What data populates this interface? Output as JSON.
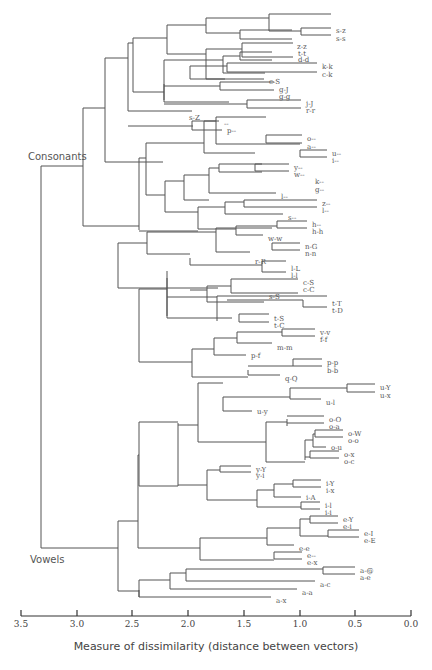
{
  "groups": [
    {
      "label": "Consonants",
      "x": 28,
      "y": 160
    },
    {
      "label": "Vowels",
      "x": 30,
      "y": 563
    }
  ],
  "axis": {
    "label": "Measure of dissimilarity (distance between vectors)",
    "y": 616,
    "x0": 21,
    "x1": 411,
    "ticks": [
      {
        "label": "3.5",
        "x": 21
      },
      {
        "label": "3.0",
        "x": 77
      },
      {
        "label": "2.5",
        "x": 132
      },
      {
        "label": "2.0",
        "x": 188
      },
      {
        "label": "1.5",
        "x": 244
      },
      {
        "label": "1.0",
        "x": 300
      },
      {
        "label": "0.5",
        "x": 355
      },
      {
        "label": "0.0",
        "x": 411
      }
    ]
  },
  "leaves": [
    {
      "label": "s-z",
      "x": 334,
      "y": 30
    },
    {
      "label": "s-s",
      "x": 334,
      "y": 38
    },
    {
      "label": "z-z",
      "x": 295,
      "y": 46
    },
    {
      "label": "t-t",
      "x": 296,
      "y": 53
    },
    {
      "label": "d-d",
      "x": 296,
      "y": 59
    },
    {
      "label": "k-k",
      "x": 320,
      "y": 66
    },
    {
      "label": "c-k",
      "x": 320,
      "y": 74
    },
    {
      "label": "c-S",
      "x": 267,
      "y": 81
    },
    {
      "label": "g-J",
      "x": 277,
      "y": 89
    },
    {
      "label": "g-g",
      "x": 277,
      "y": 96
    },
    {
      "label": "j-J",
      "x": 304,
      "y": 103
    },
    {
      "label": "r-r",
      "x": 304,
      "y": 110
    },
    {
      "label": "s-Z",
      "x": 187,
      "y": 117
    },
    {
      "label": "--",
      "x": 222,
      "y": 123
    },
    {
      "label": "p--",
      "x": 225,
      "y": 130
    },
    {
      "label": "o--",
      "x": 305,
      "y": 138
    },
    {
      "label": "a--",
      "x": 305,
      "y": 146
    },
    {
      "label": "u--",
      "x": 330,
      "y": 153
    },
    {
      "label": "i--",
      "x": 330,
      "y": 160
    },
    {
      "label": "y--",
      "x": 292,
      "y": 167
    },
    {
      "label": "w--",
      "x": 292,
      "y": 174
    },
    {
      "label": "k--",
      "x": 313,
      "y": 181
    },
    {
      "label": "g--",
      "x": 313,
      "y": 189
    },
    {
      "label": "l--",
      "x": 279,
      "y": 196
    },
    {
      "label": "z--",
      "x": 320,
      "y": 203
    },
    {
      "label": "l--",
      "x": 320,
      "y": 210
    },
    {
      "label": "s--",
      "x": 286,
      "y": 217
    },
    {
      "label": "h--",
      "x": 310,
      "y": 224
    },
    {
      "label": "h-h",
      "x": 310,
      "y": 231
    },
    {
      "label": "w-w",
      "x": 266,
      "y": 238
    },
    {
      "label": "n-G",
      "x": 303,
      "y": 246
    },
    {
      "label": "n-n",
      "x": 303,
      "y": 253
    },
    {
      "label": "r-R",
      "x": 253,
      "y": 261
    },
    {
      "label": "l-L",
      "x": 289,
      "y": 268
    },
    {
      "label": "l-l",
      "x": 289,
      "y": 275
    },
    {
      "label": "c-S",
      "x": 301,
      "y": 282
    },
    {
      "label": "c-C",
      "x": 301,
      "y": 289
    },
    {
      "label": "s-S",
      "x": 267,
      "y": 296
    },
    {
      "label": "t-T",
      "x": 330,
      "y": 303
    },
    {
      "label": "t-D",
      "x": 330,
      "y": 310
    },
    {
      "label": "t-S",
      "x": 272,
      "y": 318
    },
    {
      "label": "t-C",
      "x": 272,
      "y": 325
    },
    {
      "label": "v-v",
      "x": 318,
      "y": 332
    },
    {
      "label": "f-f",
      "x": 318,
      "y": 339
    },
    {
      "label": "m-m",
      "x": 275,
      "y": 347
    },
    {
      "label": "p-f",
      "x": 249,
      "y": 355
    },
    {
      "label": "p-p",
      "x": 325,
      "y": 362
    },
    {
      "label": "b-b",
      "x": 325,
      "y": 370
    },
    {
      "label": "q-Q",
      "x": 283,
      "y": 378
    },
    {
      "label": "u-Y",
      "x": 378,
      "y": 387
    },
    {
      "label": "u-x",
      "x": 378,
      "y": 395
    },
    {
      "label": "u-l",
      "x": 324,
      "y": 402
    },
    {
      "label": "u-y",
      "x": 255,
      "y": 411
    },
    {
      "label": "o-O",
      "x": 327,
      "y": 419
    },
    {
      "label": "o-a",
      "x": 327,
      "y": 426
    },
    {
      "label": "o-W",
      "x": 346,
      "y": 433
    },
    {
      "label": "o-o",
      "x": 346,
      "y": 440
    },
    {
      "label": "o-u",
      "x": 329,
      "y": 447
    },
    {
      "label": "o-x",
      "x": 342,
      "y": 454
    },
    {
      "label": "o-c",
      "x": 342,
      "y": 461
    },
    {
      "label": "y-Y",
      "x": 254,
      "y": 469
    },
    {
      "label": "y-i",
      "x": 254,
      "y": 475
    },
    {
      "label": "i-Y",
      "x": 324,
      "y": 483
    },
    {
      "label": "i-x",
      "x": 324,
      "y": 490
    },
    {
      "label": "i-A",
      "x": 304,
      "y": 497
    },
    {
      "label": "i-l",
      "x": 323,
      "y": 505
    },
    {
      "label": "i-i",
      "x": 323,
      "y": 512
    },
    {
      "label": "e-Y",
      "x": 341,
      "y": 519
    },
    {
      "label": "e-i",
      "x": 341,
      "y": 526
    },
    {
      "label": "e-I",
      "x": 362,
      "y": 533
    },
    {
      "label": "e-E",
      "x": 362,
      "y": 540
    },
    {
      "label": "e-e",
      "x": 297,
      "y": 548
    },
    {
      "label": "e--",
      "x": 305,
      "y": 555
    },
    {
      "label": "e-x",
      "x": 305,
      "y": 562
    },
    {
      "label": "a-@",
      "x": 358,
      "y": 570
    },
    {
      "label": "a-e",
      "x": 358,
      "y": 577
    },
    {
      "label": "a-c",
      "x": 318,
      "y": 584
    },
    {
      "label": "a-a",
      "x": 300,
      "y": 592
    },
    {
      "label": "a-x",
      "x": 274,
      "y": 600
    }
  ],
  "branches": [
    "M41,166 L41,548",
    "M41,166 L83,166",
    "M41,548 L118,548",
    "M83,108 L83,226",
    "M83,108 L105,108",
    "M83,226 L139,226",
    "M105,58 L105,162",
    "M105,58 L128,58",
    "M105,162 L163,162",
    "M128,43 L128,111",
    "M128,43 L133,43",
    "M128,111 L192,111",
    "M128,126 L193,126",
    "M133,38 L133,92",
    "M133,38 L167,38",
    "M133,92 L164,92",
    "M167,25 L167,54",
    "M167,25 L206,25",
    "M167,54 L206,54",
    "M206,18 L206,33",
    "M206,18 L269,18",
    "M206,33 L240,33",
    "M269,14 L269,31",
    "M269,14 L331,14",
    "M269,31 L301,31",
    "M301,28 L301,35",
    "M301,28 L331,28",
    "M301,35 L331,35",
    "M240,30 L240,39",
    "M240,30 L292,30",
    "M240,39 L292,39",
    "M206,54 L206,54",
    "M206,49 L206,79",
    "M206,49 L242,49",
    "M206,79 L264,79",
    "M242,43 L242,57",
    "M242,43 L293,43",
    "M242,57 L293,57",
    "M164,60 L164,102",
    "M164,60 L223,60",
    "M164,102 L229,102",
    "M223,56 L223,73",
    "M223,56 L240,56",
    "M223,73 L265,73",
    "M240,52 L240,60",
    "M240,52 L272,52",
    "M240,60 L272,60",
    "M190,66 L190,79",
    "M190,66 L227,66",
    "M190,79 L225,79",
    "M227,63 L227,72",
    "M227,63 L317,63",
    "M227,72 L317,72",
    "M164,100 L164,100",
    "M164,84 L164,100",
    "M164,86 L220,86",
    "M220,82 L220,90",
    "M220,82 L274,82",
    "M220,90 L274,90",
    "M164,104 L247,104",
    "M247,100 L247,108",
    "M247,100 L301,100",
    "M247,108 L301,108",
    "M192,121 L192,130",
    "M192,121 L219,121",
    "M192,130 L222,130",
    "M139,158 L139,230",
    "M139,158 L146,158",
    "M139,231 L198,231",
    "M146,143 L146,195",
    "M146,143 L204,143",
    "M146,195 L165,195",
    "M204,121 L204,153",
    "M204,121 L216,121",
    "M204,153 L255,153",
    "M216,117 L216,144",
    "M216,117 L266,117",
    "M216,144 L300,144",
    "M266,135 L266,143",
    "M266,135 L302,135",
    "M266,143 L302,143",
    "M300,150 L300,157",
    "M300,150 L327,150",
    "M300,157 L327,157",
    "M255,164 L255,171",
    "M255,164 L289,164",
    "M255,171 L289,171",
    "M165,181 L165,212",
    "M165,181 L184,181",
    "M165,212 L198,212",
    "M184,175 L184,200",
    "M184,175 L209,175",
    "M184,200 L209,200",
    "M209,168 L209,193",
    "M209,168 L219,168",
    "M209,193 L276,193",
    "M219,164 L219,172",
    "M219,164 L262,164",
    "M219,172 L262,172",
    "M198,207 L198,229",
    "M198,207 L225,207",
    "M198,229 L236,229",
    "M225,202 L225,214",
    "M225,202 L244,202",
    "M225,214 L283,214",
    "M244,200 L244,207",
    "M244,200 L317,200",
    "M244,207 L317,207",
    "M236,226 L236,235",
    "M236,226 L277,226",
    "M236,235 L263,235",
    "M277,221 L277,228",
    "M277,221 L307,221",
    "M277,228 L307,228",
    "M118,243 L118,288",
    "M118,243 L147,243",
    "M118,288 L218,288",
    "M147,232 L147,254",
    "M147,232 L216,232",
    "M147,254 L190,254",
    "M216,228 L216,252",
    "M216,228 L272,228",
    "M216,252 L250,252",
    "M272,243 L272,250",
    "M272,243 L300,243",
    "M272,250 L300,250",
    "M190,258 L190,265",
    "M190,265 L262,265",
    "M262,261 L262,272",
    "M262,261 L286,261",
    "M262,272 L286,272",
    "M139,289 L139,362",
    "M139,289 L167,289",
    "M139,362 L192,362",
    "M167,271 L167,316",
    "M167,271 L167,271",
    "M167,278 L167,318",
    "M167,297 L217,297",
    "M167,318 L232,318",
    "M190,290 L207,290",
    "M207,286 L207,302",
    "M207,286 L231,286",
    "M207,302 L264,302",
    "M231,279 L231,293",
    "M231,279 L298,279",
    "M231,293 L298,293",
    "M217,296 L217,321",
    "M217,296 L327,296",
    "M227,300 L303,300",
    "M303,300 L303,307",
    "M303,307 L327,307",
    "M239,314 L239,322",
    "M239,314 L269,314",
    "M239,322 L269,322",
    "M192,349 L192,377",
    "M192,349 L214,349",
    "M192,377 L248,377",
    "M214,338 L214,355",
    "M214,338 L237,338",
    "M214,355 L246,355",
    "M237,332 L237,343",
    "M237,332 L282,332",
    "M237,343 L272,343",
    "M282,329 L282,336",
    "M282,329 L315,329",
    "M282,336 L315,336",
    "M248,370 L248,375",
    "M248,366 L293,366",
    "M248,375 L280,375",
    "M293,359 L293,366",
    "M293,359 L322,359",
    "M293,366 L322,366",
    "M118,521 L118,591",
    "M118,521 L138,521",
    "M118,591 L139,591",
    "M138,455 L138,548",
    "M138,455 L139,455",
    "M138,548 L200,548",
    "M139,422 L139,486",
    "M139,422 L178,422",
    "M139,486 L178,486",
    "M178,423 L178,486",
    "M178,425 L198,425",
    "M178,485 L207,485",
    "M198,383 L198,442",
    "M198,383 L223,383",
    "M198,442 L266,442",
    "M223,397 L223,411",
    "M223,397 L290,397",
    "M223,411 L252,411",
    "M290,388 L290,399",
    "M290,388 L347,388",
    "M290,399 L321,399",
    "M347,384 L347,392",
    "M347,384 L375,384",
    "M347,392 L375,392",
    "M266,422 L266,462",
    "M266,422 L287,422",
    "M266,462 L305,462",
    "M287,419 L287,426",
    "M287,416 L324,416",
    "M287,423 L324,423",
    "M305,440 L305,460",
    "M305,440 L313,440",
    "M313,434 L313,447",
    "M313,434 L315,434",
    "M315,430 L315,437",
    "M315,430 L343,430",
    "M315,437 L343,437",
    "M313,447 L326,447",
    "M305,457 L310,457",
    "M310,451 L310,458",
    "M310,451 L339,451",
    "M310,458 L339,458",
    "M207,470 L207,500",
    "M207,470 L220,470",
    "M207,500 L257,500",
    "M220,466 L220,472",
    "M220,466 L251,466",
    "M220,472 L251,472",
    "M257,490 L257,507",
    "M257,490 L274,490",
    "M257,507 L301,507",
    "M274,484 L274,497",
    "M274,484 L293,484",
    "M274,497 L301,497",
    "M293,480 L293,487",
    "M293,480 L321,480",
    "M293,487 L321,487",
    "M301,502 L301,509",
    "M301,502 L320,502",
    "M301,509 L320,509",
    "M200,538 L200,560",
    "M200,538 L267,538",
    "M200,560 L274,560",
    "M267,528 L267,545",
    "M267,528 L300,528",
    "M267,545 L294,545",
    "M300,519 L300,536",
    "M300,519 L310,519",
    "M300,536 L328,536",
    "M310,516 L310,523",
    "M310,516 L338,516",
    "M310,523 L338,523",
    "M328,530 L328,537",
    "M328,530 L359,530",
    "M328,537 L359,537",
    "M274,552 L274,559",
    "M274,552 L302,552",
    "M274,559 L302,559",
    "M139,590 L139,597",
    "M139,580 L139,597",
    "M139,580 L170,580",
    "M139,597 L271,597",
    "M170,573 L170,589",
    "M170,573 L186,573",
    "M170,589 L297,589",
    "M186,569 L186,581",
    "M186,569 L323,569",
    "M186,581 L315,581",
    "M323,567 L323,574",
    "M323,567 L355,567",
    "M323,574 L355,574"
  ]
}
